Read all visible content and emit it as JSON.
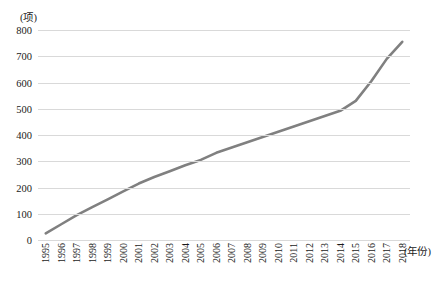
{
  "chart_data": {
    "type": "line",
    "title": "",
    "subtitle": "",
    "xlabel": "(年份)",
    "ylabel": "(项)",
    "unit_label": "(项)",
    "grid": "horizontal",
    "legend": "none",
    "xlim": [
      1995,
      2018
    ],
    "ylim": [
      0,
      800
    ],
    "y_ticks": [
      800,
      700,
      600,
      500,
      400,
      300,
      200,
      100,
      0
    ],
    "categories": [
      "1995",
      "1996",
      "1997",
      "1998",
      "1999",
      "2000",
      "2001",
      "2002",
      "2003",
      "2004",
      "2005",
      "2006",
      "2007",
      "2008",
      "2009",
      "2010",
      "2011",
      "2012",
      "2013",
      "2014",
      "2015",
      "2016",
      "2017",
      "2018"
    ],
    "series": [
      {
        "name": "累计项数",
        "color": "#808080",
        "values": [
          25,
          60,
          95,
          125,
          155,
          185,
          215,
          240,
          262,
          285,
          305,
          332,
          352,
          372,
          392,
          412,
          432,
          452,
          472,
          492,
          530,
          605,
          690,
          755
        ]
      }
    ]
  },
  "axis": {
    "y_unit": "(项)",
    "x_unit": "(年份)"
  }
}
